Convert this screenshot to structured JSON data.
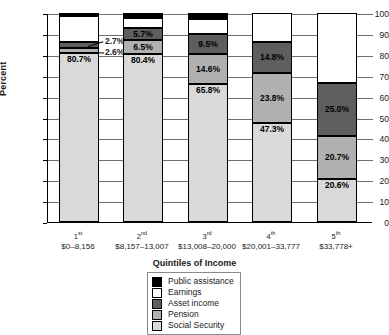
{
  "chart_data": {
    "type": "bar",
    "subtype": "stacked-bar-100",
    "title": "",
    "xlabel": "Quintiles of Income",
    "ylabel": "Percent",
    "ylim": [
      0,
      100
    ],
    "ytick_step": 10,
    "yticks": [
      "0",
      "10",
      "20",
      "30",
      "40",
      "50",
      "60",
      "70",
      "80",
      "90",
      "100"
    ],
    "grid": true,
    "legend_position": "bottom-center",
    "categories": [
      "1st",
      "2nd",
      "3rd",
      "4th",
      "5th"
    ],
    "category_ranges": [
      "$0–8,156",
      "$8,157–13,007",
      "$13,008–20,000",
      "$20,001–33,777",
      "$33,778+"
    ],
    "series": [
      {
        "name": "Social Security",
        "color": "#d9d9d9",
        "values": [
          80.7,
          80.4,
          65.8,
          47.3,
          20.6
        ]
      },
      {
        "name": "Pension",
        "color": "#b0b0b0",
        "values": [
          2.6,
          6.5,
          14.6,
          23.8,
          20.7
        ]
      },
      {
        "name": "Asset income",
        "color": "#5e5e5e",
        "values": [
          2.7,
          5.7,
          9.5,
          14.8,
          25.0
        ]
      },
      {
        "name": "Earnings",
        "color": "#ffffff",
        "values": [
          12.6,
          5.2,
          7.4,
          14.1,
          33.7
        ]
      },
      {
        "name": "Public assistance",
        "color": "#000000",
        "values": [
          1.4,
          2.2,
          2.7,
          0.0,
          0.0
        ]
      }
    ]
  },
  "axis": {
    "y_label": "Percent",
    "x_label": "Quintiles of Income",
    "ticks": [
      {
        "value": "100",
        "pct": 100
      },
      {
        "value": "90",
        "pct": 90
      },
      {
        "value": "80",
        "pct": 80
      },
      {
        "value": "70",
        "pct": 70
      },
      {
        "value": "60",
        "pct": 60
      },
      {
        "value": "50",
        "pct": 50
      },
      {
        "value": "40",
        "pct": 40
      },
      {
        "value": "30",
        "pct": 30
      },
      {
        "value": "20",
        "pct": 20
      },
      {
        "value": "10",
        "pct": 10
      },
      {
        "value": "0",
        "pct": 0
      }
    ]
  },
  "bars": [
    {
      "quintile": "1",
      "ordinal": "st",
      "range": "$0–8,156",
      "segments": [
        {
          "series": "Public assistance",
          "value": 1.4,
          "label": ""
        },
        {
          "series": "Earnings",
          "value": 12.6,
          "label": ""
        },
        {
          "series": "Asset income",
          "value": 2.7,
          "label": ""
        },
        {
          "series": "Pension",
          "value": 2.6,
          "label": ""
        },
        {
          "series": "Social Security",
          "value": 80.7,
          "label": "80.7%"
        }
      ]
    },
    {
      "quintile": "2",
      "ordinal": "nd",
      "range": "$8,157–13,007",
      "segments": [
        {
          "series": "Public assistance",
          "value": 2.2,
          "label": ""
        },
        {
          "series": "Earnings",
          "value": 5.2,
          "label": ""
        },
        {
          "series": "Asset income",
          "value": 5.7,
          "label": "5.7%"
        },
        {
          "series": "Pension",
          "value": 6.5,
          "label": "6.5%"
        },
        {
          "series": "Social Security",
          "value": 80.4,
          "label": "80.4%"
        }
      ]
    },
    {
      "quintile": "3",
      "ordinal": "rd",
      "range": "$13,008–20,000",
      "segments": [
        {
          "series": "Public assistance",
          "value": 2.7,
          "label": ""
        },
        {
          "series": "Earnings",
          "value": 7.4,
          "label": ""
        },
        {
          "series": "Asset income",
          "value": 9.5,
          "label": "9.5%"
        },
        {
          "series": "Pension",
          "value": 14.6,
          "label": "14.6%"
        },
        {
          "series": "Social Security",
          "value": 65.8,
          "label": "65.8%"
        }
      ]
    },
    {
      "quintile": "4",
      "ordinal": "th",
      "range": "$20,001–33,777",
      "segments": [
        {
          "series": "Earnings",
          "value": 14.1,
          "label": ""
        },
        {
          "series": "Asset income",
          "value": 14.8,
          "label": "14.8%"
        },
        {
          "series": "Pension",
          "value": 23.8,
          "label": "23.8%"
        },
        {
          "series": "Social Security",
          "value": 47.3,
          "label": "47.3%"
        }
      ]
    },
    {
      "quintile": "5",
      "ordinal": "th",
      "range": "$33,778+",
      "segments": [
        {
          "series": "Earnings",
          "value": 33.7,
          "label": ""
        },
        {
          "series": "Asset income",
          "value": 25.0,
          "label": "25.0%"
        },
        {
          "series": "Pension",
          "value": 20.7,
          "label": "20.7%"
        },
        {
          "series": "Social Security",
          "value": 20.6,
          "label": "20.6%"
        }
      ]
    }
  ],
  "callouts": [
    {
      "text": "2.7%",
      "series": "Asset income",
      "bar": "1"
    },
    {
      "text": "2.6%",
      "series": "Pension",
      "bar": "1"
    }
  ],
  "legend": {
    "items": [
      {
        "label": "Public assistance",
        "color": "#000000"
      },
      {
        "label": "Earnings",
        "color": "#ffffff"
      },
      {
        "label": "Asset income",
        "color": "#5e5e5e"
      },
      {
        "label": "Pension",
        "color": "#b0b0b0"
      },
      {
        "label": "Social Security",
        "color": "#d9d9d9"
      }
    ]
  }
}
